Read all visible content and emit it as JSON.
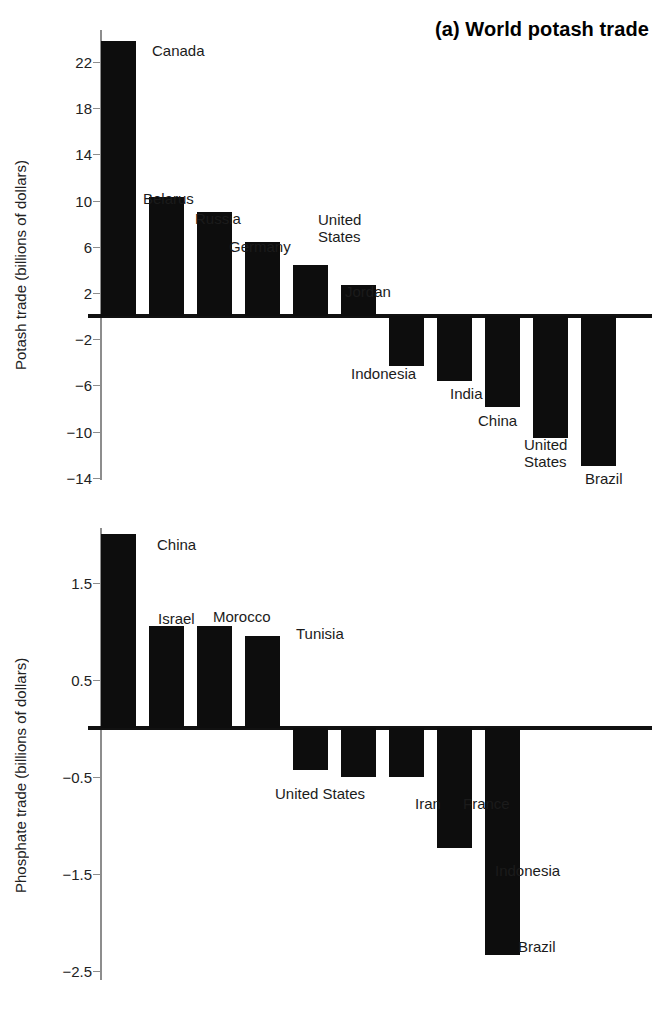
{
  "figure": {
    "width": 657,
    "height": 1009,
    "bar_color": "#0d0d0d",
    "axis_color": "#8d8d8d",
    "text_color": "#1b1b1b"
  },
  "chart_data": [
    {
      "type": "bar",
      "panel": "a",
      "title": "(a) World potash trade",
      "xlabel": "",
      "ylabel": "Potash trade (billions of dollars)",
      "ylim": [
        -14,
        24.5
      ],
      "yticks": [
        22,
        18,
        14,
        10,
        6,
        2,
        -2,
        -6,
        -10,
        -14
      ],
      "ytick_labels": [
        "22",
        "18",
        "14",
        "10",
        "6",
        "2",
        "−2",
        "−6",
        "−10",
        "−14"
      ],
      "grid": false,
      "legend": "none",
      "categories": [
        "Canada",
        "Belarus",
        "Russia",
        "Germany",
        "United States",
        "Jordan",
        "Indonesia",
        "India",
        "China",
        "United States",
        "Brazil"
      ],
      "values": [
        23.8,
        10.3,
        9.0,
        6.4,
        4.4,
        2.7,
        -4.3,
        -5.6,
        -7.9,
        -10.6,
        -13.0
      ],
      "annotations": [
        {
          "text": "Canada",
          "x": 152,
          "y": 42,
          "align": "left"
        },
        {
          "text": "Belarus",
          "x": 143,
          "y": 190,
          "align": "left"
        },
        {
          "text": "Russia",
          "x": 195,
          "y": 210,
          "align": "left"
        },
        {
          "text": "Germany",
          "x": 229,
          "y": 238,
          "align": "left"
        },
        {
          "text": "United",
          "x": 318,
          "y": 211,
          "align": "left"
        },
        {
          "text": "States",
          "x": 318,
          "y": 228,
          "align": "left"
        },
        {
          "text": "Jordan",
          "x": 345,
          "y": 283,
          "align": "left"
        },
        {
          "text": "Indonesia",
          "x": 351,
          "y": 365,
          "align": "left"
        },
        {
          "text": "India",
          "x": 450,
          "y": 385,
          "align": "left"
        },
        {
          "text": "China",
          "x": 478,
          "y": 412,
          "align": "left"
        },
        {
          "text": "United",
          "x": 524,
          "y": 436,
          "align": "left"
        },
        {
          "text": "States",
          "x": 524,
          "y": 453,
          "align": "left"
        },
        {
          "text": "Brazil",
          "x": 585,
          "y": 470,
          "align": "left"
        }
      ]
    },
    {
      "type": "bar",
      "panel": "b",
      "title": "(b) World phosphate trade",
      "xlabel": "",
      "ylabel": "Phosphate trade (billions of dollars)",
      "ylim": [
        -2.5,
        2.15
      ],
      "yticks": [
        1.5,
        0.5,
        -0.5,
        -1.5,
        -2.5
      ],
      "ytick_labels": [
        "1.5",
        "0.5",
        "−0.5",
        "−1.5",
        "−2.5"
      ],
      "grid": false,
      "legend": "none",
      "categories": [
        "China",
        "Israel",
        "Morocco",
        "Tunisia",
        "United States",
        "Iran",
        "France",
        "Indonesia",
        "Brazil"
      ],
      "values": [
        2.0,
        1.05,
        1.05,
        0.95,
        -0.43,
        -0.5,
        -0.5,
        -1.24,
        -2.34
      ],
      "annotations": [
        {
          "text": "China",
          "x": 157,
          "y": 536,
          "align": "left"
        },
        {
          "text": "Israel",
          "x": 158,
          "y": 610,
          "align": "left"
        },
        {
          "text": "Morocco",
          "x": 213,
          "y": 608,
          "align": "left"
        },
        {
          "text": "Tunisia",
          "x": 296,
          "y": 625,
          "align": "left"
        },
        {
          "text": "United States",
          "x": 275,
          "y": 785,
          "align": "left"
        },
        {
          "text": "Iran",
          "x": 415,
          "y": 795,
          "align": "left"
        },
        {
          "text": "France",
          "x": 463,
          "y": 795,
          "align": "left"
        },
        {
          "text": "Indonesia",
          "x": 495,
          "y": 862,
          "align": "left"
        },
        {
          "text": "Brazil",
          "x": 518,
          "y": 938,
          "align": "left"
        }
      ]
    }
  ],
  "panel_a": {
    "title": "(a) World potash trade",
    "ylabel": "Potash trade (billions of dollars)",
    "ytick_labels": [
      "22",
      "18",
      "14",
      "10",
      "6",
      "2",
      "−2",
      "−6",
      "−10",
      "−14"
    ],
    "labels": [
      "Canada",
      "Belarus",
      "Russia",
      "Germany",
      "United",
      "States",
      "Jordan",
      "Indonesia",
      "India",
      "China",
      "United",
      "States",
      "Brazil"
    ]
  },
  "panel_b": {
    "title": "(b) World phosphate trade",
    "ylabel": "Phosphate trade (billions of dollars)",
    "ytick_labels": [
      "1.5",
      "0.5",
      "−0.5",
      "−1.5",
      "−2.5"
    ],
    "labels": [
      "China",
      "Israel",
      "Morocco",
      "Tunisia",
      "United States",
      "Iran",
      "France",
      "Indonesia",
      "Brazil"
    ]
  }
}
